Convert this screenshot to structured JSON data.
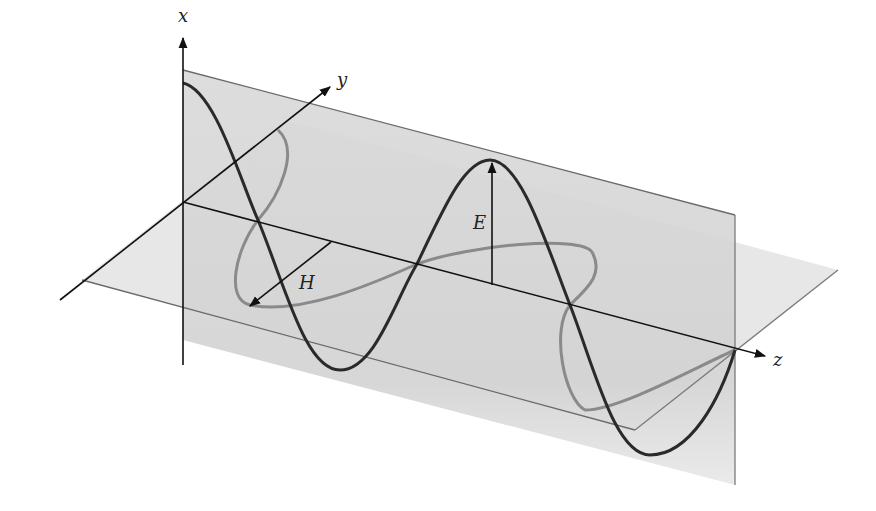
{
  "colors": {
    "background": "#ffffff",
    "axis": "#1a1a1a",
    "e_wave": "#2a2a2a",
    "h_wave": "#8a8a8a",
    "vertical_plane": "#d6d6d6",
    "horizontal_plane": "#e4e4e4",
    "plane_edge": "#6a6a6a"
  },
  "axes": {
    "x": {
      "label": "x"
    },
    "y": {
      "label": "y"
    },
    "z": {
      "label": "z"
    }
  },
  "vectors": {
    "electric": {
      "label": "E"
    },
    "magnetic": {
      "label": "H"
    }
  },
  "waves": [
    {
      "name": "E",
      "plane": "xz (vertical)",
      "shape": "sinusoid"
    },
    {
      "name": "H",
      "plane": "yz (horizontal)",
      "shape": "sinusoid"
    }
  ]
}
